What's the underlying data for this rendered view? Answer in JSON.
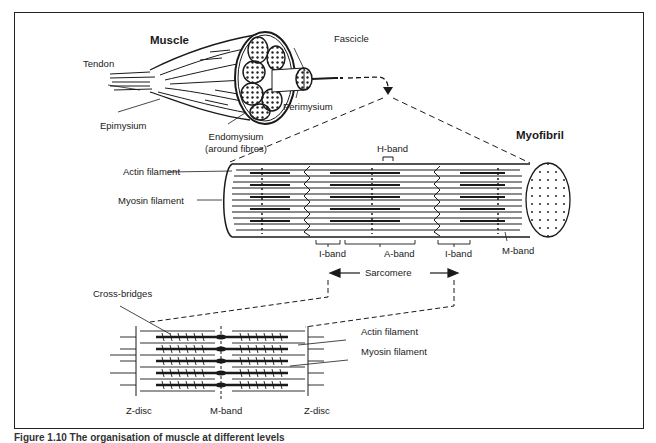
{
  "diagram": {
    "title_top": "Muscle",
    "labels": {
      "muscle": "Muscle",
      "tendon": "Tendon",
      "epimysium": "Epimysium",
      "endomysium": "Endomysium",
      "endomysium_note": "(around fibres)",
      "fascicle": "Fascicle",
      "perimysium": "Perimysium",
      "myofibril": "Myofibril",
      "h_band": "H-band",
      "actin_filament_top": "Actin filament",
      "myosin_filament_top": "Myosin filament",
      "i_band_left": "I-band",
      "a_band": "A-band",
      "i_band_right": "I-band",
      "m_band_top": "M-band",
      "sarcomere": "Sarcomere",
      "cross_bridges": "Cross-bridges",
      "actin_filament_bottom": "Actin filament",
      "myosin_filament_bottom": "Myosin filament",
      "z_disc_left": "Z-disc",
      "m_band_bottom": "M-band",
      "z_disc_right": "Z-disc"
    },
    "levels": [
      "Muscle",
      "Fascicle",
      "Myofibril",
      "Sarcomere"
    ],
    "colors": {
      "ink": "#1a1a1a",
      "background": "#ffffff"
    }
  },
  "caption": "Figure 1.10  The organisation of muscle at different levels"
}
